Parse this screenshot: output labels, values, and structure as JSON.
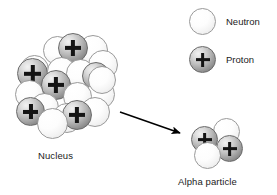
{
  "diagram": {
    "title_alt": "Alpha decay: nucleus emitting an alpha particle",
    "colors": {
      "background": "#ffffff",
      "neutron_fill": "#f5f5f5",
      "neutron_stroke": "#9a9a9a",
      "proton_fill": "#9a9a9a",
      "proton_stroke": "#6a6a6a",
      "text": "#1b1b1b",
      "arrow": "#000000"
    }
  },
  "legend": {
    "items": [
      {
        "icon": "neutron-sphere-icon",
        "label": "Neutron",
        "type": "neutron"
      },
      {
        "icon": "proton-sphere-icon",
        "label": "Proton",
        "type": "proton"
      }
    ]
  },
  "nucleus": {
    "label": "Nucleus",
    "proton_count": 6,
    "neutron_count": 14,
    "particles": [
      {
        "type": "neutron",
        "x": 43,
        "y": 36,
        "d": 29
      },
      {
        "type": "neutron",
        "x": 78,
        "y": 35,
        "d": 30
      },
      {
        "type": "proton",
        "x": 58,
        "y": 33,
        "d": 30
      },
      {
        "type": "neutron",
        "x": 20,
        "y": 55,
        "d": 29
      },
      {
        "type": "neutron",
        "x": 88,
        "y": 50,
        "d": 30
      },
      {
        "type": "proton",
        "x": 17,
        "y": 58,
        "d": 31
      },
      {
        "type": "neutron",
        "x": 47,
        "y": 57,
        "d": 29
      },
      {
        "type": "neutron",
        "x": 66,
        "y": 59,
        "d": 29
      },
      {
        "type": "proton",
        "x": 82,
        "y": 62,
        "d": 28
      },
      {
        "type": "neutron",
        "x": 15,
        "y": 80,
        "d": 29
      },
      {
        "type": "proton",
        "x": 41,
        "y": 70,
        "d": 30
      },
      {
        "type": "neutron",
        "x": 86,
        "y": 80,
        "d": 29
      },
      {
        "type": "neutron",
        "x": 63,
        "y": 82,
        "d": 29
      },
      {
        "type": "neutron",
        "x": 30,
        "y": 93,
        "d": 29
      },
      {
        "type": "proton",
        "x": 16,
        "y": 97,
        "d": 29
      },
      {
        "type": "neutron",
        "x": 80,
        "y": 97,
        "d": 30
      },
      {
        "type": "neutron",
        "x": 52,
        "y": 103,
        "d": 30
      },
      {
        "type": "proton",
        "x": 62,
        "y": 100,
        "d": 30
      },
      {
        "type": "neutron",
        "x": 37,
        "y": 108,
        "d": 31
      },
      {
        "type": "neutron",
        "x": 88,
        "y": 66,
        "d": 28
      }
    ]
  },
  "alpha_particle": {
    "label": "Alpha particle",
    "proton_count": 2,
    "neutron_count": 2,
    "particles": [
      {
        "type": "neutron",
        "x": 213,
        "y": 118,
        "d": 27
      },
      {
        "type": "proton",
        "x": 191,
        "y": 126,
        "d": 27
      },
      {
        "type": "proton",
        "x": 216,
        "y": 135,
        "d": 27
      },
      {
        "type": "neutron",
        "x": 194,
        "y": 142,
        "d": 27
      }
    ]
  },
  "arrow": {
    "name": "emission-arrow",
    "x1": 120,
    "y1": 112,
    "x2": 180,
    "y2": 133
  }
}
